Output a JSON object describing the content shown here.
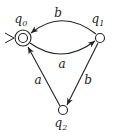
{
  "diagram": {
    "type": "finite-automaton",
    "states": [
      {
        "id": "q0",
        "label": "q",
        "sub": "0",
        "initial": true,
        "accepting": true
      },
      {
        "id": "q1",
        "label": "q",
        "sub": "1",
        "initial": false,
        "accepting": false
      },
      {
        "id": "q2",
        "label": "q",
        "sub": "2",
        "initial": false,
        "accepting": false
      }
    ],
    "transitions": [
      {
        "from": "q1",
        "to": "q0",
        "symbol": "b"
      },
      {
        "from": "q0",
        "to": "q1",
        "symbol": "a"
      },
      {
        "from": "q2",
        "to": "q0",
        "symbol": "a"
      },
      {
        "from": "q1",
        "to": "q2",
        "symbol": "b"
      }
    ],
    "colors": {
      "stroke": "#222222",
      "background": "#ffffff"
    }
  }
}
